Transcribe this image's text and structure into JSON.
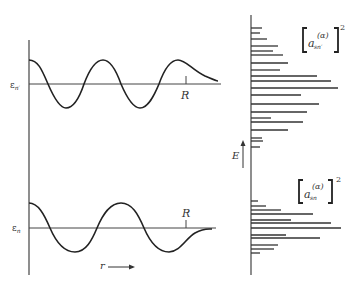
{
  "left_panel": {
    "upper_level_label": "ε",
    "upper_level_sub": "n′",
    "lower_level_label": "ε",
    "lower_level_sub": "n",
    "boundary_label_upper": "R",
    "boundary_label_lower": "R",
    "r_axis_label": "r"
  },
  "right_panel": {
    "energy_label": "E",
    "upper_coef": {
      "base": "a",
      "sub": "sn′",
      "sup": "(α)",
      "power": "2"
    },
    "lower_coef": {
      "base": "a",
      "sub": "sn",
      "sup": "(α)",
      "power": "2"
    },
    "axis_x": 251,
    "upper_bars": [
      {
        "y": 28,
        "end": 262
      },
      {
        "y": 33,
        "end": 260
      },
      {
        "y": 39,
        "end": 267
      },
      {
        "y": 46,
        "end": 278
      },
      {
        "y": 51,
        "end": 273
      },
      {
        "y": 55,
        "end": 283
      },
      {
        "y": 63,
        "end": 288
      },
      {
        "y": 70,
        "end": 280
      },
      {
        "y": 76,
        "end": 317
      },
      {
        "y": 81,
        "end": 331
      },
      {
        "y": 88,
        "end": 338
      },
      {
        "y": 95,
        "end": 301
      },
      {
        "y": 104,
        "end": 319
      },
      {
        "y": 112,
        "end": 307
      },
      {
        "y": 118,
        "end": 271
      },
      {
        "y": 122,
        "end": 303
      },
      {
        "y": 130,
        "end": 288
      },
      {
        "y": 138,
        "end": 262
      },
      {
        "y": 141,
        "end": 263
      },
      {
        "y": 147,
        "end": 260
      }
    ],
    "lower_bars": [
      {
        "y": 201,
        "end": 258
      },
      {
        "y": 206,
        "end": 266
      },
      {
        "y": 210,
        "end": 281
      },
      {
        "y": 214,
        "end": 313
      },
      {
        "y": 220,
        "end": 291
      },
      {
        "y": 223,
        "end": 331
      },
      {
        "y": 228,
        "end": 341
      },
      {
        "y": 235,
        "end": 286
      },
      {
        "y": 238,
        "end": 320
      },
      {
        "y": 245,
        "end": 278
      },
      {
        "y": 249,
        "end": 274
      },
      {
        "y": 253,
        "end": 260
      }
    ]
  }
}
